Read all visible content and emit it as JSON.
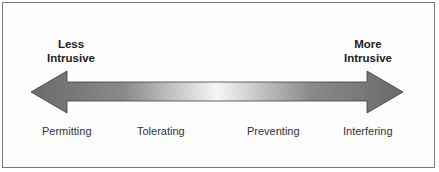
{
  "diagram": {
    "type": "bidirectional-spectrum-arrow",
    "left_end": {
      "line1": "Less",
      "line2": "Intrusive"
    },
    "right_end": {
      "line1": "More",
      "line2": "Intrusive"
    },
    "scale_points": [
      "Permitting",
      "Tolerating",
      "Preventing",
      "Interfering"
    ],
    "colors": {
      "arrow_dark": "#6e6e6e",
      "arrow_light": "#f4f4f4",
      "border": "#7a7a7a"
    }
  }
}
